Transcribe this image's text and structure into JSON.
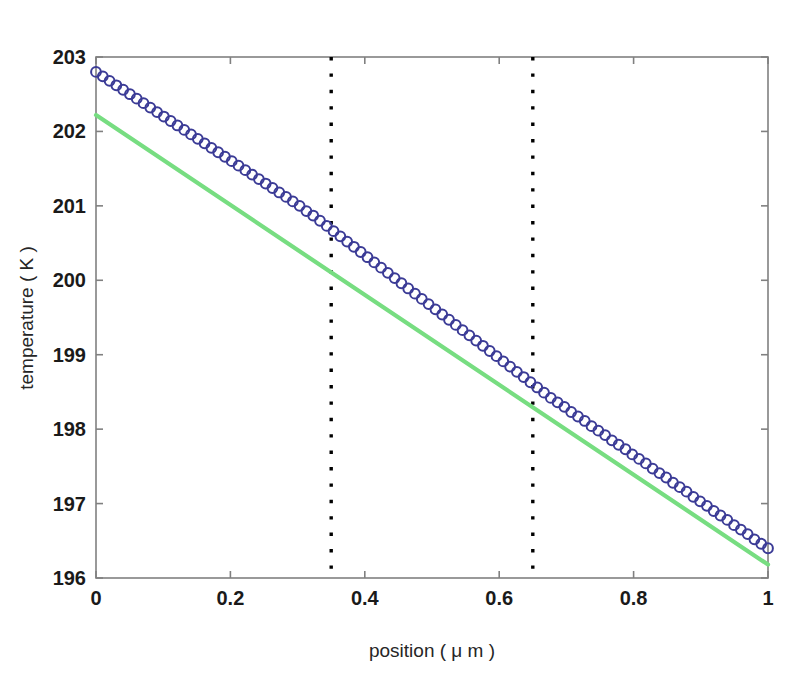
{
  "chart_data": {
    "type": "line",
    "title": "",
    "xlabel": "position ( μ m )",
    "ylabel": "temperature ( K )",
    "xlim": [
      0,
      1
    ],
    "ylim": [
      196,
      203
    ],
    "grid": false,
    "legend": null,
    "xticks": [
      0,
      0.2,
      0.4,
      0.6,
      0.8,
      1
    ],
    "xticklabels": [
      "0",
      "0.2",
      "0.4",
      "0.6",
      "0.8",
      "1"
    ],
    "yticks": [
      196,
      197,
      198,
      199,
      200,
      201,
      202,
      203
    ],
    "yticklabels": [
      "196",
      "197",
      "198",
      "199",
      "200",
      "201",
      "202",
      "203"
    ],
    "series": [
      {
        "name": "temperature profile",
        "style": "markers",
        "marker": "circle-open",
        "color": "#3b3b96",
        "x": [
          0,
          0.0101,
          0.0202,
          0.0303,
          0.0404,
          0.0505,
          0.0606,
          0.0707,
          0.0808,
          0.0909,
          0.101,
          0.1111,
          0.1212,
          0.1313,
          0.1414,
          0.1515,
          0.1616,
          0.1717,
          0.1818,
          0.1919,
          0.202,
          0.2121,
          0.2222,
          0.2323,
          0.2424,
          0.2525,
          0.2626,
          0.2727,
          0.2828,
          0.2929,
          0.303,
          0.3131,
          0.3232,
          0.3333,
          0.3434,
          0.3535,
          0.3636,
          0.3737,
          0.3838,
          0.3939,
          0.404,
          0.4141,
          0.4242,
          0.4343,
          0.4444,
          0.4545,
          0.4646,
          0.4747,
          0.4848,
          0.4949,
          0.5051,
          0.5152,
          0.5253,
          0.5354,
          0.5455,
          0.5556,
          0.5657,
          0.5758,
          0.5859,
          0.596,
          0.6061,
          0.6162,
          0.6263,
          0.6364,
          0.6465,
          0.6566,
          0.6667,
          0.6768,
          0.6869,
          0.697,
          0.7071,
          0.7172,
          0.7273,
          0.7374,
          0.7475,
          0.7576,
          0.7677,
          0.7778,
          0.7879,
          0.798,
          0.8081,
          0.8182,
          0.8283,
          0.8384,
          0.8485,
          0.8586,
          0.8687,
          0.8788,
          0.8889,
          0.899,
          0.9091,
          0.9192,
          0.9293,
          0.9394,
          0.9495,
          0.9596,
          0.9697,
          0.9798,
          0.9899,
          1.0
        ],
        "y": [
          202.8,
          202.74,
          202.68,
          202.62,
          202.56,
          202.5,
          202.44,
          202.38,
          202.32,
          202.26,
          202.2,
          202.14,
          202.08,
          202.02,
          201.96,
          201.9,
          201.84,
          201.78,
          201.72,
          201.66,
          201.6,
          201.54,
          201.48,
          201.42,
          201.36,
          201.3,
          201.24,
          201.18,
          201.12,
          201.06,
          201.0,
          200.93,
          200.87,
          200.8,
          200.73,
          200.66,
          200.59,
          200.52,
          200.45,
          200.38,
          200.31,
          200.24,
          200.17,
          200.1,
          200.03,
          199.96,
          199.89,
          199.82,
          199.75,
          199.68,
          199.61,
          199.54,
          199.47,
          199.4,
          199.33,
          199.26,
          199.19,
          199.12,
          199.05,
          198.98,
          198.91,
          198.84,
          198.77,
          198.7,
          198.63,
          198.56,
          198.49,
          198.42,
          198.36,
          198.3,
          198.23,
          198.17,
          198.11,
          198.04,
          197.98,
          197.92,
          197.85,
          197.79,
          197.73,
          197.66,
          197.6,
          197.54,
          197.47,
          197.41,
          197.35,
          197.28,
          197.22,
          197.16,
          197.09,
          197.03,
          196.97,
          196.9,
          196.84,
          196.78,
          196.71,
          196.65,
          196.59,
          196.52,
          196.46,
          196.4
        ]
      },
      {
        "name": "linear fit",
        "style": "line",
        "color": "#77dd81",
        "x": [
          0,
          1
        ],
        "y": [
          202.22,
          196.18
        ]
      }
    ],
    "annotations": [
      {
        "name": "boundary-left",
        "type": "vline",
        "x": 0.35,
        "style": "dotted",
        "color": "#000000"
      },
      {
        "name": "boundary-right",
        "type": "vline",
        "x": 0.65,
        "style": "dotted",
        "color": "#000000"
      }
    ]
  },
  "colors": {
    "data_markers": "#3b3b96",
    "fit_line": "#77dd81",
    "axes": "#808080",
    "text": "#1a1a1a",
    "vline": "#000000",
    "background": "#ffffff"
  }
}
